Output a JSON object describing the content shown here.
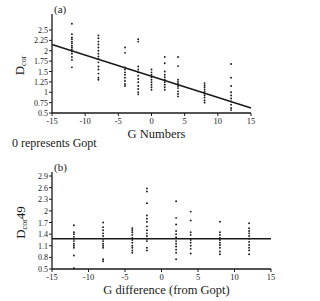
{
  "note": "0 represents Gopt",
  "chart_data": [
    {
      "panel": "(a)",
      "type": "scatter",
      "title": "",
      "xlabel": "G Numbers",
      "ylabel": "Dcor",
      "ylabel_main": "D",
      "ylabel_sub": "cor",
      "xlim": [
        -15,
        15
      ],
      "ylim": [
        0.5,
        2.5
      ],
      "xticks": [
        -15,
        -10,
        -5,
        0,
        5,
        10,
        15
      ],
      "yticks": [
        0.5,
        0.75,
        1,
        1.25,
        1.5,
        1.75,
        2,
        2.25,
        2.5
      ],
      "grid": false,
      "trend_line": {
        "x": [
          -15,
          15
        ],
        "y": [
          2.15,
          0.62
        ]
      },
      "series": [
        {
          "name": "observations",
          "points": [
            [
              -12,
              2.65
            ],
            [
              -12,
              2.4
            ],
            [
              -12,
              2.32
            ],
            [
              -12,
              2.28
            ],
            [
              -12,
              2.22
            ],
            [
              -12,
              2.18
            ],
            [
              -12,
              2.12
            ],
            [
              -12,
              2.08
            ],
            [
              -12,
              2.03
            ],
            [
              -12,
              1.98
            ],
            [
              -12,
              1.93
            ],
            [
              -12,
              1.85
            ],
            [
              -12,
              1.78
            ],
            [
              -12,
              1.6
            ],
            [
              -8,
              2.37
            ],
            [
              -8,
              2.3
            ],
            [
              -8,
              2.22
            ],
            [
              -8,
              2.15
            ],
            [
              -8,
              2.08
            ],
            [
              -8,
              2.0
            ],
            [
              -8,
              1.93
            ],
            [
              -8,
              1.86
            ],
            [
              -8,
              1.8
            ],
            [
              -8,
              1.72
            ],
            [
              -8,
              1.62
            ],
            [
              -8,
              1.55
            ],
            [
              -8,
              1.45
            ],
            [
              -8,
              1.35
            ],
            [
              -8,
              1.3
            ],
            [
              -4,
              2.08
            ],
            [
              -4,
              1.95
            ],
            [
              -4,
              1.6
            ],
            [
              -4,
              1.55
            ],
            [
              -4,
              1.48
            ],
            [
              -4,
              1.42
            ],
            [
              -4,
              1.35
            ],
            [
              -4,
              1.27
            ],
            [
              -4,
              1.2
            ],
            [
              -4,
              1.15
            ],
            [
              -2,
              2.28
            ],
            [
              -2,
              2.22
            ],
            [
              -2,
              1.62
            ],
            [
              -2,
              1.55
            ],
            [
              -2,
              1.48
            ],
            [
              -2,
              1.4
            ],
            [
              -2,
              1.32
            ],
            [
              -2,
              1.24
            ],
            [
              -2,
              1.15
            ],
            [
              -2,
              1.08
            ],
            [
              -2,
              1.0
            ],
            [
              -2,
              0.95
            ],
            [
              0,
              1.55
            ],
            [
              0,
              1.48
            ],
            [
              0,
              1.42
            ],
            [
              0,
              1.36
            ],
            [
              0,
              1.3
            ],
            [
              0,
              1.24
            ],
            [
              0,
              1.18
            ],
            [
              0,
              1.12
            ],
            [
              0,
              1.06
            ],
            [
              2,
              1.85
            ],
            [
              2,
              1.7
            ],
            [
              2,
              1.5
            ],
            [
              2,
              1.42
            ],
            [
              2,
              1.36
            ],
            [
              2,
              1.3
            ],
            [
              2,
              1.24
            ],
            [
              2,
              1.18
            ],
            [
              2,
              1.12
            ],
            [
              2,
              1.06
            ],
            [
              4,
              1.85
            ],
            [
              4,
              1.63
            ],
            [
              4,
              1.3
            ],
            [
              4,
              1.25
            ],
            [
              4,
              1.2
            ],
            [
              4,
              1.15
            ],
            [
              4,
              1.1
            ],
            [
              4,
              1.02
            ],
            [
              4,
              0.96
            ],
            [
              4,
              0.9
            ],
            [
              8,
              1.22
            ],
            [
              8,
              1.17
            ],
            [
              8,
              1.12
            ],
            [
              8,
              1.07
            ],
            [
              8,
              1.02
            ],
            [
              8,
              0.97
            ],
            [
              8,
              0.92
            ],
            [
              8,
              0.87
            ],
            [
              8,
              0.8
            ],
            [
              8,
              0.75
            ],
            [
              12,
              1.68
            ],
            [
              12,
              1.35
            ],
            [
              12,
              1.15
            ],
            [
              12,
              1.0
            ],
            [
              12,
              0.92
            ],
            [
              12,
              0.85
            ],
            [
              12,
              0.78
            ],
            [
              12,
              0.7
            ],
            [
              12,
              0.62
            ],
            [
              12,
              0.57
            ]
          ]
        }
      ]
    },
    {
      "panel": "(b)",
      "type": "scatter",
      "title": "",
      "xlabel": "G difference (from Gopt)",
      "ylabel": "Dcor49",
      "ylabel_main": "D",
      "ylabel_sub": "cor",
      "ylabel_suffix": "49",
      "xlim": [
        -15,
        15
      ],
      "ylim": [
        0.5,
        2.9
      ],
      "xticks": [
        -15,
        -10,
        -5,
        0,
        5,
        10,
        15
      ],
      "yticks": [
        0.5,
        0.8,
        1.1,
        1.4,
        1.7,
        2,
        2.3,
        2.6,
        2.9
      ],
      "grid": false,
      "reference_line": {
        "y": 1.28
      },
      "series": [
        {
          "name": "observations",
          "points": [
            [
              -12,
              1.63
            ],
            [
              -12,
              1.45
            ],
            [
              -12,
              1.4
            ],
            [
              -12,
              1.33
            ],
            [
              -12,
              1.28
            ],
            [
              -12,
              1.22
            ],
            [
              -12,
              1.15
            ],
            [
              -12,
              1.1
            ],
            [
              -12,
              1.05
            ],
            [
              -12,
              0.85
            ],
            [
              -12,
              0.52
            ],
            [
              -8,
              1.7
            ],
            [
              -8,
              1.58
            ],
            [
              -8,
              1.5
            ],
            [
              -8,
              1.42
            ],
            [
              -8,
              1.35
            ],
            [
              -8,
              1.28
            ],
            [
              -8,
              1.22
            ],
            [
              -8,
              1.15
            ],
            [
              -8,
              1.1
            ],
            [
              -8,
              1.05
            ],
            [
              -8,
              0.75
            ],
            [
              -8,
              0.7
            ],
            [
              -4,
              1.55
            ],
            [
              -4,
              1.5
            ],
            [
              -4,
              1.45
            ],
            [
              -4,
              1.38
            ],
            [
              -4,
              1.3
            ],
            [
              -4,
              1.25
            ],
            [
              -4,
              1.18
            ],
            [
              -4,
              1.1
            ],
            [
              -4,
              1.05
            ],
            [
              -4,
              0.98
            ],
            [
              -4,
              0.92
            ],
            [
              -2,
              2.58
            ],
            [
              -2,
              2.5
            ],
            [
              -2,
              2.2
            ],
            [
              -2,
              1.88
            ],
            [
              -2,
              1.8
            ],
            [
              -2,
              1.72
            ],
            [
              -2,
              1.6
            ],
            [
              -2,
              1.5
            ],
            [
              -2,
              1.42
            ],
            [
              -2,
              1.35
            ],
            [
              -2,
              1.28
            ],
            [
              -2,
              1.22
            ],
            [
              -2,
              1.05
            ],
            [
              -2,
              0.98
            ],
            [
              2,
              2.25
            ],
            [
              2,
              1.82
            ],
            [
              2,
              1.65
            ],
            [
              2,
              1.48
            ],
            [
              2,
              1.4
            ],
            [
              2,
              1.32
            ],
            [
              2,
              1.22
            ],
            [
              2,
              1.15
            ],
            [
              2,
              1.08
            ],
            [
              2,
              1.0
            ],
            [
              2,
              0.92
            ],
            [
              2,
              0.75
            ],
            [
              4,
              1.98
            ],
            [
              4,
              1.75
            ],
            [
              4,
              1.45
            ],
            [
              4,
              1.38
            ],
            [
              4,
              1.25
            ],
            [
              4,
              1.18
            ],
            [
              4,
              1.1
            ],
            [
              4,
              1.02
            ],
            [
              4,
              0.9
            ],
            [
              8,
              1.72
            ],
            [
              8,
              1.45
            ],
            [
              8,
              1.38
            ],
            [
              8,
              1.3
            ],
            [
              8,
              1.25
            ],
            [
              8,
              1.18
            ],
            [
              8,
              1.12
            ],
            [
              8,
              1.05
            ],
            [
              8,
              0.95
            ],
            [
              8,
              0.88
            ],
            [
              12,
              1.68
            ],
            [
              12,
              1.55
            ],
            [
              12,
              1.48
            ],
            [
              12,
              1.42
            ],
            [
              12,
              1.35
            ],
            [
              12,
              1.28
            ],
            [
              12,
              1.2
            ],
            [
              12,
              1.12
            ],
            [
              12,
              1.05
            ],
            [
              12,
              0.98
            ],
            [
              12,
              0.88
            ]
          ]
        }
      ]
    }
  ],
  "layout": [
    {
      "plot": {
        "x0": 52,
        "x1": 251,
        "y0": 113,
        "y1": 30
      },
      "xaxis_y": 113,
      "ytop_px": 14
    },
    {
      "plot": {
        "x0": 52,
        "x1": 271,
        "y0": 269,
        "y1": 176
      },
      "xaxis_y": 269,
      "ytop_px": 172
    }
  ],
  "colors": {
    "ink": "#1a1a1a",
    "background": "#ffffff"
  }
}
